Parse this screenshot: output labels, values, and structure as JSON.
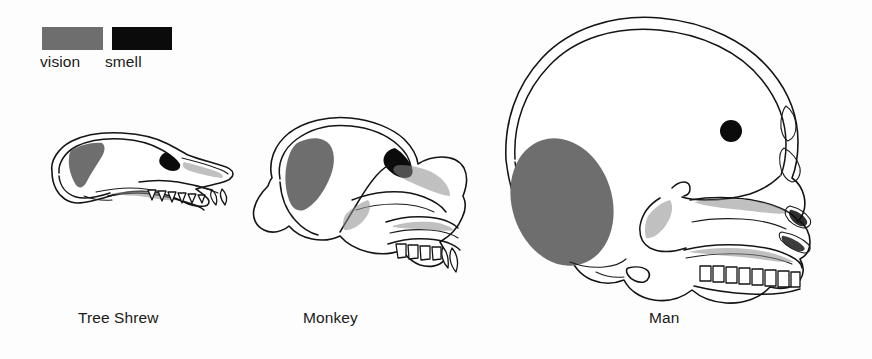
{
  "figure": {
    "background_color": "#fdfdfd"
  },
  "legend": {
    "items": [
      {
        "label": "vision",
        "color": "#6e6e6e",
        "swatch_name": "vision-swatch"
      },
      {
        "label": "smell",
        "color": "#0b0b0b",
        "swatch_name": "smell-swatch"
      }
    ]
  },
  "specimens": [
    {
      "caption": "Tree Shrew",
      "vision_color": "#6e6e6e",
      "smell_color": "#0b0b0b",
      "vision_size": "small",
      "smell_size": "small-wedge"
    },
    {
      "caption": "Monkey",
      "vision_color": "#6e6e6e",
      "smell_color": "#0b0b0b",
      "vision_size": "medium",
      "smell_size": "small-wedge"
    },
    {
      "caption": "Man",
      "vision_color": "#6e6e6e",
      "smell_color": "#0b0b0b",
      "vision_size": "large",
      "smell_size": "small-dot"
    }
  ]
}
